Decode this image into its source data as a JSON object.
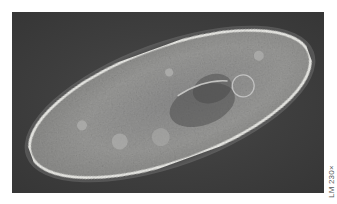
{
  "figure": {
    "magnification_label": "LM 230×"
  },
  "colors": {
    "background": "#3e3e3e",
    "cell_body": "#9a9a9a",
    "cell_outline": "#f2f2ee",
    "page": "#ffffff"
  }
}
